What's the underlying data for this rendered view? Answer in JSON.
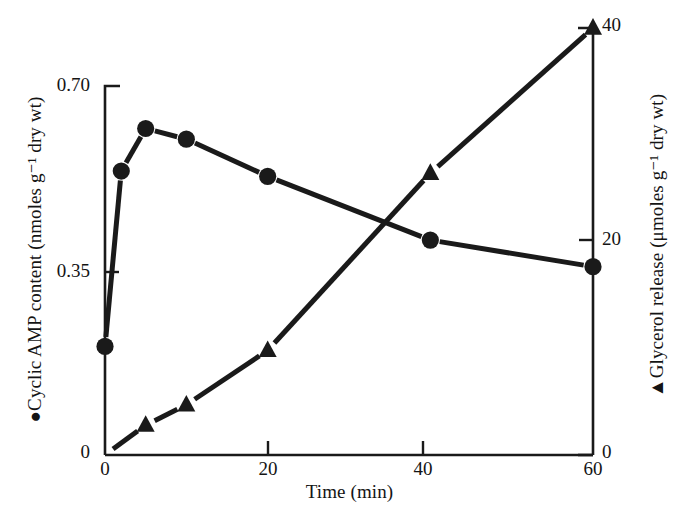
{
  "figure": {
    "background": "#ffffff",
    "ink_color": "#1a1a1a"
  },
  "axes": {
    "x": {
      "title": "Time (min)",
      "tick_labels": [
        "0",
        "20",
        "40",
        "60"
      ],
      "tick_values": [
        0,
        20,
        40,
        60
      ],
      "range": [
        0,
        60
      ]
    },
    "y_left": {
      "title": "●Cyclic AMP content (nmoles g⁻¹ dry wt)",
      "marker": "filled-circle",
      "tick_labels": [
        "0",
        "0.35",
        "0.70"
      ],
      "tick_values": [
        0,
        0.35,
        0.7
      ],
      "range": [
        0,
        0.7
      ]
    },
    "y_right": {
      "title": "▲Glycerol release (μmoles g⁻¹ dry wt)",
      "marker": "filled-triangle",
      "tick_labels": [
        "0",
        "20",
        "40"
      ],
      "tick_values": [
        0,
        20,
        40
      ],
      "range": [
        0,
        40
      ]
    }
  },
  "chart_data": {
    "type": "line",
    "title": "",
    "xlabel": "Time (min)",
    "ylabel": "●Cyclic AMP content (nmoles g⁻¹ dry wt)",
    "ylabel_right": "▲Glycerol release (μmoles g⁻¹ dry wt)",
    "xlim": [
      0,
      60
    ],
    "ylim": [
      0,
      0.7
    ],
    "ylim_right": [
      0,
      40
    ],
    "grid": false,
    "legend": "none",
    "x_ticks": [
      0,
      20,
      40,
      60
    ],
    "y_left_ticks": [
      0,
      0.35,
      0.7
    ],
    "y_right_ticks": [
      0,
      20,
      40
    ],
    "series": [
      {
        "name": "Cyclic AMP content",
        "axis": "left",
        "marker": "circle",
        "units": "nmoles g-1 dry wt",
        "x": [
          0,
          2,
          5,
          10,
          20,
          40,
          60
        ],
        "values": [
          0.21,
          0.54,
          0.62,
          0.6,
          0.53,
          0.41,
          0.36
        ]
      },
      {
        "name": "Glycerol release",
        "axis": "right",
        "marker": "triangle",
        "units": "umoles g-1 dry wt",
        "x": [
          0,
          5,
          10,
          20,
          40,
          60
        ],
        "values": [
          0,
          2.8,
          4.7,
          9.8,
          26.4,
          40.0
        ]
      }
    ]
  }
}
